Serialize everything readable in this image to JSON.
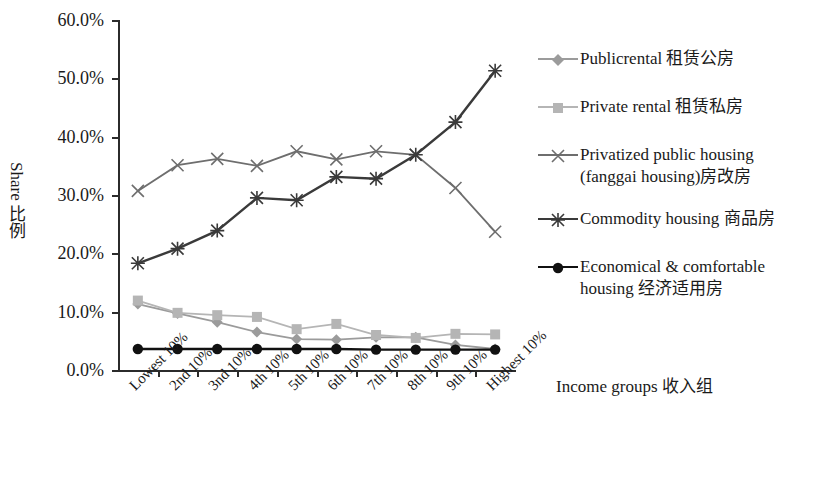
{
  "axis": {
    "y_title": "Share 比例",
    "x_title": "Income groups 收入组",
    "y_ticks": [
      "60.0%",
      "50.0%",
      "40.0%",
      "30.0%",
      "20.0%",
      "10.0%",
      "0.0%"
    ]
  },
  "legend": {
    "items": [
      {
        "label": "Publicrental 租赁公房",
        "label2": "",
        "marker": "diamond-marker",
        "color": "#9b9b9b"
      },
      {
        "label": "Private rental 租赁私房",
        "label2": "",
        "marker": "square-marker",
        "color": "#b5b5b5"
      },
      {
        "label": "Privatized public housing",
        "label2": "(fanggai housing)房改房",
        "marker": "x-marker",
        "color": "#6e6e6e"
      },
      {
        "label": "Commodity housing 商品房",
        "label2": "",
        "marker": "asterisk-marker",
        "color": "#3a3a3a"
      },
      {
        "label": "Economical & comfortable",
        "label2": "housing 经济适用房",
        "marker": "circle-marker",
        "color": "#111111"
      }
    ]
  },
  "chart_data": {
    "type": "line",
    "title": "",
    "xlabel": "Income groups 收入组",
    "ylabel": "Share 比例",
    "ylim": [
      0,
      60
    ],
    "ytick_values": [
      0,
      10,
      20,
      30,
      40,
      50,
      60
    ],
    "grid": false,
    "legend_position": "right",
    "categories": [
      "Lowest 10%",
      "2nd 10%",
      "3nd 10%",
      "4th 10%",
      "5th 10%",
      "6th 10%",
      "7th 10%",
      "8th 10%",
      "9th 10%",
      "Highest 10%"
    ],
    "series": [
      {
        "name": "Publicrental 租赁公房",
        "color": "#9b9b9b",
        "marker": "diamond",
        "values": [
          11.3,
          9.7,
          8.2,
          6.5,
          5.3,
          5.2,
          5.6,
          5.6,
          4.3,
          3.6
        ]
      },
      {
        "name": "Private rental 租赁私房",
        "color": "#b5b5b5",
        "marker": "square",
        "values": [
          11.9,
          9.8,
          9.4,
          9.1,
          7.0,
          7.9,
          6.0,
          5.5,
          6.2,
          6.1
        ]
      },
      {
        "name": "Privatized public housing (fanggai housing)房改房",
        "color": "#6e6e6e",
        "marker": "x",
        "values": [
          30.7,
          35.1,
          36.2,
          35.0,
          37.5,
          36.1,
          37.5,
          36.9,
          31.2,
          23.7
        ]
      },
      {
        "name": "Commodity housing 商品房",
        "color": "#3a3a3a",
        "marker": "asterisk",
        "values": [
          18.3,
          20.8,
          23.9,
          29.5,
          29.1,
          33.1,
          32.8,
          36.9,
          42.5,
          51.3
        ]
      },
      {
        "name": "Economical & comfortable housing 经济适用房",
        "color": "#111111",
        "marker": "circle",
        "values": [
          3.6,
          3.6,
          3.6,
          3.6,
          3.6,
          3.6,
          3.5,
          3.5,
          3.5,
          3.5
        ]
      }
    ]
  }
}
